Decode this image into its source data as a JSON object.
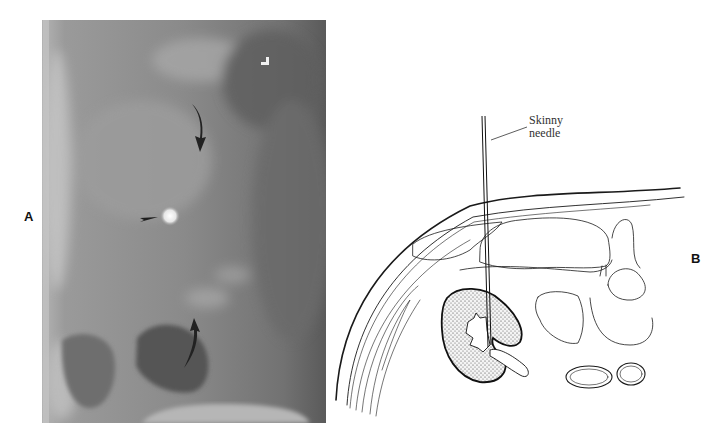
{
  "figure": {
    "panels": [
      {
        "id": "A",
        "label": "A",
        "type": "fluoroscopic-radiograph",
        "markers": [
          {
            "kind": "curved-arrow",
            "direction": "down",
            "description": "upper curved arrow"
          },
          {
            "kind": "arrowhead",
            "direction": "right",
            "description": "arrowhead pointing to bright opacity"
          },
          {
            "kind": "curved-arrow",
            "direction": "up",
            "description": "lower curved arrow"
          },
          {
            "kind": "orientation-marker",
            "glyph": "L-shaped corner marker"
          }
        ]
      },
      {
        "id": "B",
        "label": "B",
        "type": "line-illustration",
        "callout": {
          "line1": "Skinny",
          "line2": "needle"
        },
        "structures": [
          "body wall",
          "needle",
          "kidney",
          "renal pelvis",
          "bowel loops",
          "vertebra",
          "aorta",
          "inferior vena cava"
        ]
      }
    ],
    "colors": {
      "background": "#ffffff",
      "xray_mid": "#8a8a8a",
      "xray_dark": "#5e5e5e",
      "xray_light": "#b8b8b8",
      "ink": "#1a1a1a",
      "label": "#111111"
    }
  }
}
